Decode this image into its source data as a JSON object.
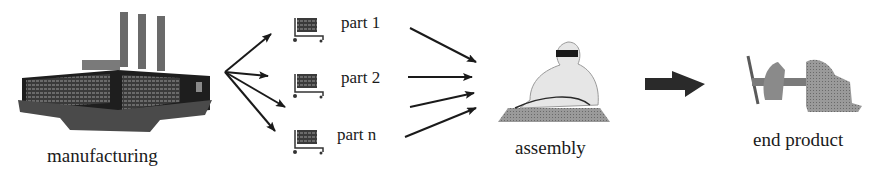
{
  "diagram": {
    "type": "process-flow",
    "stages": [
      {
        "id": "manufacturing",
        "label": "manufacturing",
        "icon": "factory-icon"
      },
      {
        "id": "parts",
        "items": [
          {
            "label": "part 1",
            "icon": "cart-icon"
          },
          {
            "label": "part 2",
            "icon": "cart-icon"
          },
          {
            "label": "part n",
            "icon": "cart-icon"
          }
        ]
      },
      {
        "id": "assembly",
        "label": "assembly",
        "icon": "worker-icon"
      },
      {
        "id": "end_product",
        "label": "end product",
        "icon": "vise-icon"
      }
    ],
    "edges": [
      {
        "from": "manufacturing",
        "to": "parts",
        "count": 4
      },
      {
        "from": "parts",
        "to": "assembly",
        "count": 4
      },
      {
        "from": "assembly",
        "to": "end_product",
        "style": "block-arrow"
      }
    ],
    "colors": {
      "line": "#1a1a1a",
      "fill_dark": "#2a2a2a",
      "fill_mid": "#8a8a8a",
      "fill_light": "#e8e8e8"
    }
  }
}
